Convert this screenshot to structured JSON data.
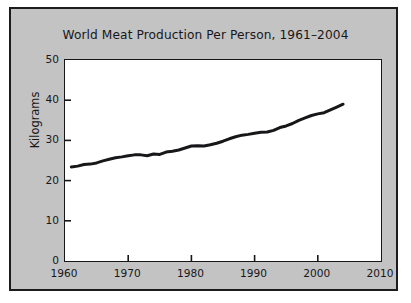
{
  "figure": {
    "background_color": "#ffffff",
    "panel_color": "#c3c3c3",
    "border_color": "#1c1c1c",
    "plot_background": "#ffffff",
    "line_color": "#17171a"
  },
  "chart_data": {
    "type": "line",
    "title": "World Meat Production Per Person, 1961–2004",
    "xlabel": "",
    "ylabel": "Kilograms",
    "xlim": [
      1960,
      2010
    ],
    "ylim": [
      0,
      50
    ],
    "xticks": [
      1960,
      1970,
      1980,
      1990,
      2000,
      2010
    ],
    "xtick_labels": [
      "1960",
      "1970",
      "1980",
      "1990",
      "2000",
      "2010"
    ],
    "yticks": [
      0,
      10,
      20,
      30,
      40,
      50
    ],
    "ytick_labels": [
      "0",
      "10",
      "20",
      "30",
      "40",
      "50"
    ],
    "grid": false,
    "legend": false,
    "series": [
      {
        "name": "World meat production per person",
        "units": "kilograms",
        "x": [
          1961,
          1962,
          1963,
          1964,
          1965,
          1966,
          1967,
          1968,
          1969,
          1970,
          1971,
          1972,
          1973,
          1974,
          1975,
          1976,
          1977,
          1978,
          1979,
          1980,
          1981,
          1982,
          1983,
          1984,
          1985,
          1986,
          1987,
          1988,
          1989,
          1990,
          1991,
          1992,
          1993,
          1994,
          1995,
          1996,
          1997,
          1998,
          1999,
          2000,
          2001,
          2002,
          2003,
          2004
        ],
        "values": [
          23.4,
          23.6,
          24.0,
          24.1,
          24.4,
          24.9,
          25.3,
          25.7,
          25.9,
          26.2,
          26.4,
          26.4,
          26.2,
          26.6,
          26.5,
          27.1,
          27.3,
          27.6,
          28.1,
          28.6,
          28.7,
          28.6,
          28.9,
          29.3,
          29.8,
          30.4,
          30.9,
          31.3,
          31.5,
          31.8,
          32.0,
          32.1,
          32.5,
          33.2,
          33.6,
          34.2,
          35.0,
          35.6,
          36.2,
          36.6,
          36.9,
          37.6,
          38.3,
          39.0
        ]
      }
    ],
    "annotations": [
      {
        "text": "start value 1961",
        "value": 23.4
      },
      {
        "text": "end value 2004",
        "value": 39.0
      },
      {
        "text": "plateau 1980–1983",
        "value": 28.7
      },
      {
        "text": "dip 1973–1974",
        "value": 26.2
      }
    ]
  }
}
